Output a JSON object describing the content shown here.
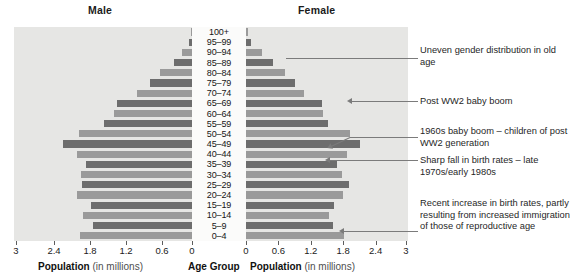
{
  "headers": {
    "male": "Male",
    "female": "Female"
  },
  "axis": {
    "left_title_bold": "Population",
    "left_title_rest": " (in millions)",
    "center_title": "Age Group",
    "right_title_bold": "Population",
    "right_title_rest": " (in millions)",
    "left_ticks": [
      "3",
      "2.4",
      "1.8",
      "1.2",
      "0.6",
      "0"
    ],
    "right_ticks": [
      "0",
      "0.6",
      "1.2",
      "1.8",
      "2.4",
      "3"
    ]
  },
  "annotations": [
    {
      "id": "uneven-gender",
      "text": "Uneven gender distribution in old age"
    },
    {
      "id": "post-ww2",
      "text": "Post WW2 baby boom"
    },
    {
      "id": "sixties-boom",
      "text": "1960s baby boom – children of post WW2 generation"
    },
    {
      "id": "birth-rate-fall",
      "text": "Sharp fall in birth rates – late 1970s/early 1980s"
    },
    {
      "id": "recent-increase",
      "text": "Recent increase in birth rates, partly resulting from increased immigration of those of reproductive age"
    }
  ],
  "colors": {
    "bar_dark": "#6d6d6d",
    "bar_light": "#9a9a9a",
    "panel_bg": "#e6e6e4",
    "center_col_bg": "#fbfbfa",
    "leader": "#7b7b7b"
  },
  "chart_data": {
    "type": "bar",
    "xlabel": "Population (in millions)",
    "ylabel": "Age Group",
    "xlim": [
      0,
      3
    ],
    "grid": false,
    "legend": [
      "Male",
      "Female"
    ],
    "orientation": "horizontal-diverging",
    "categories": [
      "100+",
      "95–99",
      "90–94",
      "85–89",
      "80–84",
      "75–79",
      "70–74",
      "65–69",
      "60–64",
      "55–59",
      "50–54",
      "45–49",
      "40–44",
      "35–39",
      "30–34",
      "25–29",
      "20–24",
      "15–19",
      "10–14",
      "5–9",
      "0–4"
    ],
    "series": [
      {
        "name": "Male",
        "values": [
          0.01,
          0.05,
          0.17,
          0.31,
          0.54,
          0.71,
          0.92,
          1.27,
          1.32,
          1.48,
          1.91,
          2.18,
          1.93,
          1.78,
          1.87,
          1.85,
          1.93,
          1.7,
          1.84,
          1.67,
          1.88
        ]
      },
      {
        "name": "Female",
        "values": [
          0.02,
          0.09,
          0.3,
          0.5,
          0.73,
          0.9,
          1.08,
          1.4,
          1.43,
          1.52,
          1.93,
          2.12,
          1.87,
          1.69,
          1.78,
          1.9,
          1.8,
          1.63,
          1.53,
          1.62,
          1.81
        ]
      }
    ]
  }
}
